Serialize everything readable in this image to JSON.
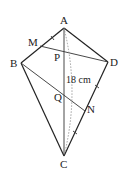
{
  "diagram": {
    "type": "kite-geometry",
    "points": {
      "A": "A",
      "B": "B",
      "C": "C",
      "D": "D",
      "M": "M",
      "N": "N",
      "P": "P",
      "Q": "Q"
    },
    "measurement_label": "18 cm",
    "segments": [
      "AB",
      "AD",
      "BC",
      "DC",
      "AC",
      "MD",
      "BN"
    ],
    "measured_segment": "AC"
  }
}
